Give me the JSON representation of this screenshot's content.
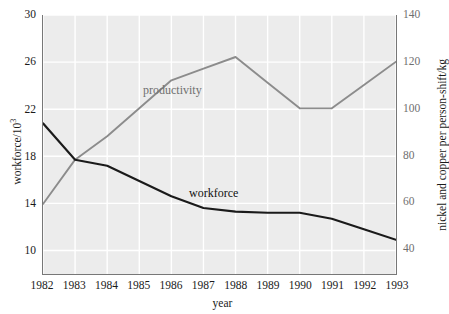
{
  "chart_data": {
    "type": "line",
    "title": "",
    "xlabel": "year",
    "x": [
      1982,
      1983,
      1984,
      1985,
      1986,
      1987,
      1988,
      1989,
      1990,
      1991,
      1992,
      1993
    ],
    "xtick_labels": [
      "1982",
      "1983",
      "1984",
      "1985",
      "1986",
      "1987",
      "1988",
      "1989",
      "1990",
      "1991",
      "1992",
      "1993"
    ],
    "xlim": [
      1982,
      1993
    ],
    "grid": true,
    "legend_position": "inline-annotations",
    "axes": {
      "left": {
        "label": "workforce/10³",
        "label_base": "workforce/10",
        "label_exponent": "3",
        "ticks": [
          10,
          14,
          18,
          22,
          26,
          30
        ],
        "tick_labels": [
          "10",
          "14",
          "18",
          "22",
          "26",
          "30"
        ],
        "ylim": [
          8,
          30
        ]
      },
      "right": {
        "label": "nickel and copper per person-shift/kg",
        "ticks": [
          40,
          60,
          80,
          100,
          120,
          140
        ],
        "tick_labels": [
          "40",
          "60",
          "80",
          "100",
          "120",
          "140"
        ],
        "ylim": [
          29,
          140
        ]
      }
    },
    "series": [
      {
        "name": "workforce",
        "axis": "left",
        "color": "#1a1a1a",
        "annotation": "workforce",
        "values": [
          20.8,
          17.7,
          17.2,
          15.9,
          14.6,
          13.6,
          13.3,
          13.2,
          13.2,
          12.7,
          11.8,
          10.9
        ]
      },
      {
        "name": "productivity",
        "axis": "right",
        "color": "#8c8c8c",
        "annotation": "productivity",
        "values": [
          59,
          78,
          88,
          100,
          112,
          117,
          122,
          111,
          100,
          100,
          110,
          120
        ]
      }
    ]
  },
  "colors": {
    "plot_background": "#ececec",
    "gridline": "#ffffff",
    "axis_line": "#777777",
    "workforce_line": "#1a1a1a",
    "productivity_line": "#8c8c8c",
    "tick_text": "#1a1a1a",
    "right_tick_text": "#6f6f6f"
  }
}
